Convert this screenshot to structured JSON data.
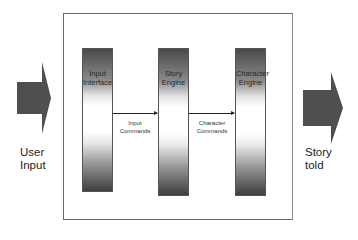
{
  "diagram": {
    "type": "flow",
    "input_arrow": {
      "label_line1": "User",
      "label_line2": "Input"
    },
    "output_arrow": {
      "label_line1": "Story",
      "label_line2": "told"
    },
    "components": [
      {
        "label_line1": "Input",
        "label_line2": "Interface"
      },
      {
        "label_line1": "Story",
        "label_line2": "Engine"
      },
      {
        "label_line1": "Character",
        "label_line2": "Engine"
      }
    ],
    "connections": [
      {
        "from": "Input Interface",
        "to": "Story Engine",
        "label_line1": "Input",
        "label_line2": "Commands"
      },
      {
        "from": "Story Engine",
        "to": "Character Engine",
        "label_line1": "Character",
        "label_line2": "Commands"
      }
    ],
    "colors": {
      "arrow_fill": "#4f4f4f",
      "pillar_dark": "#3e3e3e",
      "border": "#6a6a6a"
    }
  }
}
